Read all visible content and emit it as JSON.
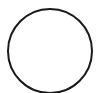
{
  "shape": {
    "type": "circle",
    "cx": 50,
    "cy": 51,
    "r": 42,
    "stroke": "#1a1a1a",
    "stroke_width": 2,
    "fill": "none"
  },
  "background": "#ffffff"
}
